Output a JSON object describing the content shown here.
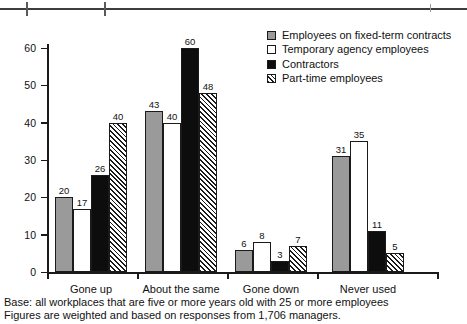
{
  "chart_data": {
    "type": "bar",
    "title": "",
    "xlabel": "",
    "ylabel": "Percent",
    "ylim": [
      0,
      60
    ],
    "yticks": [
      0,
      10,
      20,
      30,
      40,
      50,
      60
    ],
    "grid": false,
    "legend_position": "top-right",
    "categories": [
      "Gone up",
      "About the same",
      "Gone down",
      "Never used"
    ],
    "series": [
      {
        "name": "Employees on fixed-term contracts",
        "swatch": "gray",
        "color": "#9a9a9a",
        "values": [
          20,
          43,
          6,
          31
        ]
      },
      {
        "name": "Temporary agency employees",
        "swatch": "white",
        "color": "#ffffff",
        "values": [
          17,
          40,
          8,
          35
        ]
      },
      {
        "name": "Contractors",
        "swatch": "black",
        "color": "#0d0d0d",
        "values": [
          26,
          60,
          3,
          11
        ]
      },
      {
        "name": "Part-time employees",
        "swatch": "hatch",
        "color": "#ffffff",
        "values": [
          40,
          48,
          7,
          5
        ]
      }
    ]
  },
  "axis": {
    "y_title": "Percent",
    "y_ticks": [
      "0",
      "10",
      "20",
      "30",
      "40",
      "50",
      "60"
    ]
  },
  "legend": {
    "items": [
      {
        "label": "Employees on fixed-term contracts",
        "style": "gray"
      },
      {
        "label": "Temporary agency employees",
        "style": "white"
      },
      {
        "label": "Contractors",
        "style": "black"
      },
      {
        "label": "Part-time employees",
        "style": "hatch"
      }
    ]
  },
  "categories": [
    {
      "label": "Gone up"
    },
    {
      "label": "About the same"
    },
    {
      "label": "Gone down"
    },
    {
      "label": "Never used"
    }
  ],
  "footnotes": {
    "line1": "Base: all workplaces that are five or more years old with 25 or more employees",
    "line2": "Figures are weighted and based on responses from 1,706 managers."
  }
}
